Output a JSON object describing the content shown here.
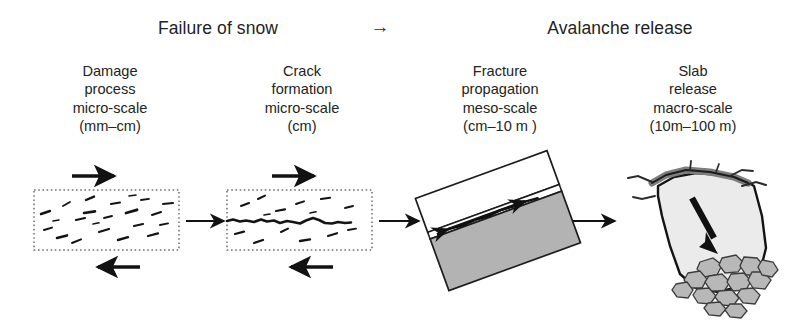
{
  "figure": {
    "title": "Failure of snow to avalanche release process chain",
    "background_color": "#ffffff",
    "ink_color": "#1a1a1a"
  },
  "header": {
    "left_phase": "Failure of snow",
    "connector_arrow": "→",
    "connector_arrow_icon": "arrow-right-glyph",
    "right_phase": "Avalanche release"
  },
  "stages": [
    {
      "name": "Damage",
      "line1": "Damage",
      "line2": "process",
      "line3": "micro-scale",
      "line4": "(mm–cm)",
      "scale_class": "micro-scale",
      "scale_range": "mm–cm",
      "panel_type": "dotted-box-with-microcracks",
      "shear_arrow_top": "right",
      "shear_arrow_bottom": "left"
    },
    {
      "name": "Crack formation",
      "line1": "Crack",
      "line2": "formation",
      "line3": "micro-scale",
      "line4": "(cm)",
      "scale_class": "micro-scale",
      "scale_range": "cm",
      "panel_type": "dotted-box-with-continuous-crack",
      "shear_arrow_top": "right",
      "shear_arrow_bottom": "left"
    },
    {
      "name": "Fracture propagation",
      "line1": "Fracture",
      "line2": "propagation",
      "line3": "meso-scale",
      "line4": "(cm–10 m )",
      "scale_class": "meso-scale",
      "scale_range": "cm–10 m",
      "panel_type": "tilted-slab-with-weak-layer",
      "slab_tilt_degrees": -20,
      "slab_fill": "#ffffff",
      "substrate_fill": "#b3b3b3",
      "weak_layer_arrow": "double-headed"
    },
    {
      "name": "Slab release",
      "line1": "Slab",
      "line2": "release",
      "line3": "macro-scale",
      "line4": "(10m–100 m)",
      "scale_class": "macro-scale",
      "scale_range": "10m–100 m",
      "panel_type": "released-slab-with-debris",
      "slab_fill": "#ebebeb",
      "crown_fill": "#7d7d7d",
      "debris_fill": "#b8b8b8",
      "motion_arrow": "down"
    }
  ],
  "connectors": [
    {
      "from": "Damage",
      "to": "Crack formation",
      "direction": "right"
    },
    {
      "from": "Crack formation",
      "to": "Fracture propagation",
      "direction": "right"
    },
    {
      "from": "Fracture propagation",
      "to": "Slab release",
      "direction": "right"
    }
  ],
  "colors": {
    "ink": "#1a1a1a",
    "slab_gray": "#b3b3b3",
    "light_slab": "#ebebeb",
    "crown_dark": "#7d7d7d",
    "debris": "#b8b8b8",
    "background": "#ffffff"
  }
}
